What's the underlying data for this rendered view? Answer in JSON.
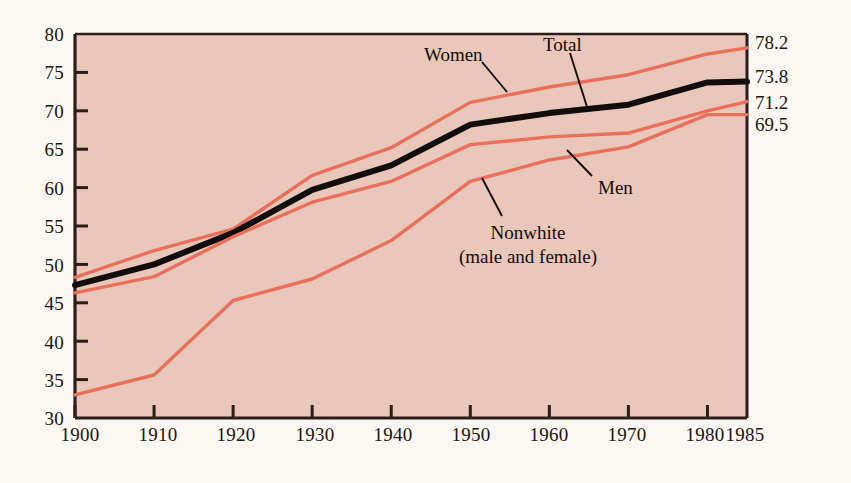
{
  "chart_data": {
    "type": "line",
    "title": "",
    "subtitle": "",
    "xlabel": "",
    "ylabel": "",
    "xlim": [
      1900,
      1985
    ],
    "ylim": [
      30,
      80
    ],
    "grid": false,
    "legend_position": "inline-annotations",
    "x": [
      1900,
      1910,
      1920,
      1930,
      1940,
      1950,
      1960,
      1970,
      1980,
      1985
    ],
    "xticks": [
      "1900",
      "1910",
      "1920",
      "1930",
      "1940",
      "1950",
      "1960",
      "1970",
      "1980",
      "1985"
    ],
    "yticks": [
      "30",
      "35",
      "40",
      "45",
      "50",
      "55",
      "60",
      "65",
      "70",
      "75",
      "80"
    ],
    "series": [
      {
        "name": "Women",
        "color": "#e8705a",
        "width": 3.4,
        "values": [
          48.3,
          51.8,
          54.6,
          61.6,
          65.2,
          71.1,
          73.1,
          74.7,
          77.4,
          78.2
        ],
        "end_label": "78.2"
      },
      {
        "name": "Total",
        "color": "#120d0b",
        "width": 6.0,
        "values": [
          47.3,
          50.0,
          54.1,
          59.7,
          62.9,
          68.2,
          69.7,
          70.8,
          73.7,
          73.8
        ],
        "end_label": "73.8"
      },
      {
        "name": "Men",
        "color": "#e8705a",
        "width": 3.4,
        "values": [
          46.3,
          48.4,
          53.6,
          58.1,
          60.8,
          65.6,
          66.6,
          67.1,
          70.0,
          71.2
        ],
        "end_label": "71.2"
      },
      {
        "name": "Nonwhite (male and female)",
        "color": "#e8705a",
        "width": 3.4,
        "values": [
          33.0,
          35.6,
          45.3,
          48.1,
          53.1,
          60.8,
          63.6,
          65.3,
          69.5,
          69.5
        ],
        "end_label": "69.5"
      }
    ],
    "annotations": [
      {
        "text": "Women",
        "target_series": "Women"
      },
      {
        "text": "Total",
        "target_series": "Total"
      },
      {
        "text": "Men",
        "target_series": "Men"
      },
      {
        "text": "Nonwhite",
        "text2": "(male and female)",
        "target_series": "Nonwhite (male and female)"
      }
    ],
    "end_labels": [
      "78.2",
      "73.8",
      "71.2",
      "69.5"
    ],
    "colors": {
      "plot_background": "#e9c7ba",
      "page_background": "#fbf8f3",
      "line_coral": "#e8705a",
      "line_black": "#120d0b",
      "axis": "#2b1d18",
      "text": "#1a1412"
    }
  }
}
